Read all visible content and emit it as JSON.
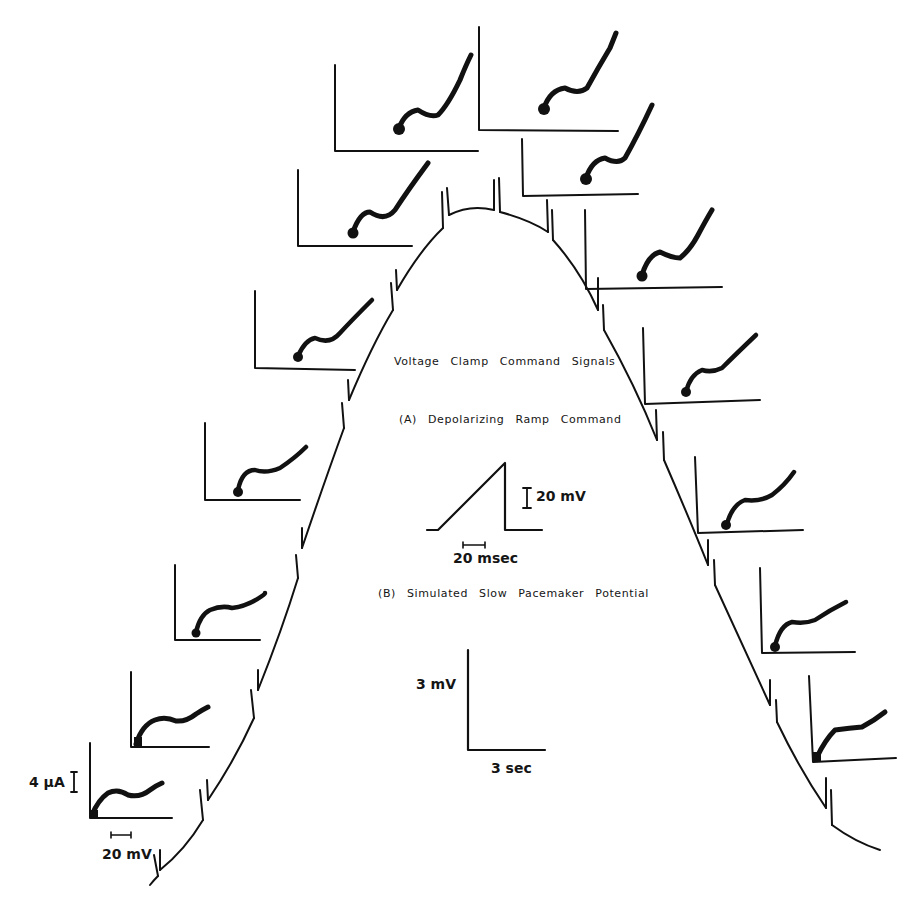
{
  "labels": {
    "title": "Voltage Clamp Command Signals",
    "part_a": "(A) Depolarizing Ramp Command",
    "part_b": "(B) Simulated Slow Pacemaker Potential",
    "ramp_v_scale": "20 mV",
    "ramp_t_scale": "20 msec",
    "pacemaker_v_scale": "3 mV",
    "pacemaker_t_scale": "3 sec",
    "iv_current_scale": "4 µA",
    "iv_voltage_scale": "20 mV"
  },
  "colors": {
    "ink": "#111111",
    "background": "#ffffff"
  },
  "figure": {
    "type": "electrophysiology diagram",
    "pacemaker_curve_points": [
      [
        150,
        885
      ],
      [
        160,
        878
      ],
      [
        200,
        835
      ],
      [
        255,
        715
      ],
      [
        300,
        560
      ],
      [
        345,
        410
      ],
      [
        395,
        300
      ],
      [
        440,
        235
      ],
      [
        480,
        210
      ],
      [
        500,
        212
      ],
      [
        550,
        230
      ],
      [
        600,
        300
      ],
      [
        640,
        390
      ],
      [
        690,
        520
      ],
      [
        730,
        610
      ],
      [
        775,
        720
      ],
      [
        820,
        800
      ],
      [
        880,
        850
      ]
    ],
    "ramp_tick_positions_x": [
      158,
      205,
      257,
      300,
      347,
      395,
      446,
      496,
      550,
      600,
      660,
      712,
      775,
      830
    ],
    "iv_panels": [
      {
        "side": "left",
        "x": 90,
        "y": 743,
        "w": 82,
        "h": 75
      },
      {
        "side": "left",
        "x": 131,
        "y": 672,
        "w": 78,
        "h": 75
      },
      {
        "side": "left",
        "x": 175,
        "y": 565,
        "w": 85,
        "h": 75
      },
      {
        "side": "left",
        "x": 205,
        "y": 423,
        "w": 95,
        "h": 77
      },
      {
        "side": "left",
        "x": 255,
        "y": 290,
        "w": 100,
        "h": 80
      },
      {
        "side": "left",
        "x": 298,
        "y": 170,
        "w": 112,
        "h": 78
      },
      {
        "side": "top",
        "x": 335,
        "y": 65,
        "w": 115,
        "h": 85
      },
      {
        "side": "top",
        "x": 478,
        "y": 27,
        "w": 110,
        "h": 103
      },
      {
        "side": "right",
        "x": 522,
        "y": 138,
        "w": 108,
        "h": 57
      },
      {
        "side": "right",
        "x": 585,
        "y": 207,
        "w": 125,
        "h": 80
      },
      {
        "side": "right",
        "x": 643,
        "y": 327,
        "w": 95,
        "h": 77
      },
      {
        "side": "right",
        "x": 695,
        "y": 457,
        "w": 88,
        "h": 72
      },
      {
        "side": "right",
        "x": 760,
        "y": 567,
        "w": 85,
        "h": 75
      },
      {
        "side": "right",
        "x": 810,
        "y": 675,
        "w": 80,
        "h": 70
      }
    ]
  }
}
